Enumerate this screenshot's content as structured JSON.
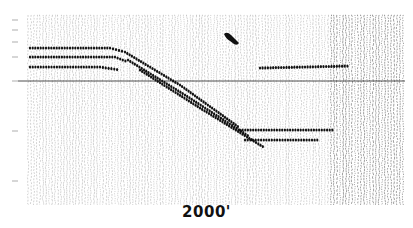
{
  "figure": {
    "type": "seismic-section",
    "scale_label": "2000'",
    "colors": {
      "background": "#ffffff",
      "traces": "#222222",
      "reflector": "#111111"
    },
    "plot_area": {
      "x0": 28,
      "x1": 403,
      "y0": 15,
      "y1": 205
    },
    "horizontal_line_y": 81,
    "left_tick_ys": [
      20,
      30,
      42,
      57,
      81,
      131,
      181
    ],
    "reflectors": [
      {
        "name": "flat-upper-1",
        "points": [
          [
            30,
            48
          ],
          [
            110,
            48
          ],
          [
            125,
            52
          ]
        ]
      },
      {
        "name": "flat-upper-2",
        "points": [
          [
            30,
            57
          ],
          [
            115,
            57
          ],
          [
            128,
            62
          ]
        ]
      },
      {
        "name": "flat-upper-3",
        "points": [
          [
            30,
            67
          ],
          [
            100,
            67
          ],
          [
            120,
            70
          ]
        ]
      },
      {
        "name": "dipping-1",
        "points": [
          [
            125,
            52
          ],
          [
            180,
            85
          ],
          [
            240,
            128
          ]
        ]
      },
      {
        "name": "dipping-2",
        "points": [
          [
            128,
            60
          ],
          [
            185,
            95
          ],
          [
            250,
            137
          ]
        ]
      },
      {
        "name": "dipping-3",
        "points": [
          [
            140,
            70
          ],
          [
            200,
            108
          ],
          [
            265,
            148
          ]
        ]
      },
      {
        "name": "flat-lower-1",
        "points": [
          [
            240,
            130
          ],
          [
            335,
            130
          ]
        ]
      },
      {
        "name": "flat-lower-2",
        "points": [
          [
            245,
            140
          ],
          [
            320,
            140
          ]
        ]
      },
      {
        "name": "flat-right",
        "points": [
          [
            260,
            68
          ],
          [
            350,
            66
          ]
        ]
      }
    ],
    "diffraction_blob": {
      "x": 228,
      "y": 37
    }
  }
}
